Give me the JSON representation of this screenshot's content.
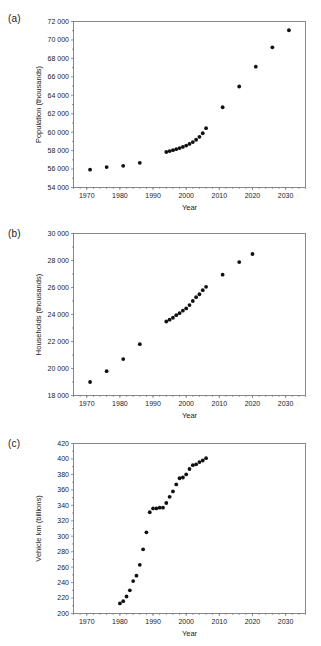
{
  "figure": {
    "background_color": "#ffffff",
    "marker_color": "#111111",
    "axis_color": "#6b6b6b"
  },
  "panels": [
    {
      "id": "a",
      "label": "(a)"
    },
    {
      "id": "b",
      "label": "(b)"
    },
    {
      "id": "c",
      "label": "(c)"
    }
  ],
  "chart_data": [
    {
      "type": "scatter",
      "panel": "(a)",
      "title": "",
      "xlabel": "Year",
      "ylabel": "Population (thousands)",
      "xlim": [
        1966,
        2036
      ],
      "ylim": [
        54000,
        72000
      ],
      "xticks": [
        1970,
        1980,
        1990,
        2000,
        2010,
        2020,
        2030
      ],
      "xticklabels": [
        "1970",
        "1980",
        "1990",
        "2000",
        "2010",
        "2020",
        "2030"
      ],
      "yticks": [
        54000,
        56000,
        58000,
        60000,
        62000,
        64000,
        66000,
        68000,
        70000,
        72000
      ],
      "yticklabels": [
        "54 000",
        "56 000",
        "58 000",
        "60 000",
        "62 000",
        "64 000",
        "66 000",
        "68 000",
        "70 000",
        "72 000"
      ],
      "grid": false,
      "legend": null,
      "x": [
        1971,
        1976,
        1981,
        1986,
        1994,
        1995,
        1996,
        1997,
        1998,
        1999,
        2000,
        2001,
        2002,
        2003,
        2004,
        2005,
        2006,
        2011,
        2016,
        2021,
        2026,
        2031
      ],
      "y": [
        55930,
        56220,
        56350,
        56680,
        57850,
        57950,
        58050,
        58160,
        58270,
        58400,
        58550,
        58720,
        58930,
        59180,
        59500,
        59880,
        60430,
        62700,
        64950,
        67100,
        69200,
        71050
      ]
    },
    {
      "type": "scatter",
      "panel": "(b)",
      "title": "",
      "xlabel": "Year",
      "ylabel": "Households (thousands)",
      "xlim": [
        1966,
        2036
      ],
      "ylim": [
        18000,
        30000
      ],
      "xticks": [
        1970,
        1980,
        1990,
        2000,
        2010,
        2020,
        2030
      ],
      "xticklabels": [
        "1970",
        "1980",
        "1990",
        "2000",
        "2010",
        "2020",
        "2030"
      ],
      "yticks": [
        18000,
        20000,
        22000,
        24000,
        26000,
        28000,
        30000
      ],
      "yticklabels": [
        "18 000",
        "20 000",
        "22 000",
        "24 000",
        "26 000",
        "28 000",
        "30 000"
      ],
      "grid": false,
      "legend": null,
      "x": [
        1971,
        1976,
        1981,
        1986,
        1994,
        1995,
        1996,
        1997,
        1998,
        1999,
        2000,
        2001,
        2002,
        2003,
        2004,
        2005,
        2006,
        2011,
        2016,
        2020
      ],
      "y": [
        19000,
        19800,
        20700,
        21800,
        23480,
        23620,
        23760,
        23950,
        24100,
        24280,
        24450,
        24700,
        25000,
        25280,
        25500,
        25800,
        26050,
        26950,
        27880,
        28480
      ]
    },
    {
      "type": "scatter",
      "panel": "(c)",
      "title": "",
      "xlabel": "Year",
      "ylabel": "Vehicle km (billions)",
      "xlim": [
        1966,
        2036
      ],
      "ylim": [
        200,
        420
      ],
      "xticks": [
        1970,
        1980,
        1990,
        2000,
        2010,
        2020,
        2030
      ],
      "xticklabels": [
        "1970",
        "1980",
        "1990",
        "2000",
        "2010",
        "2020",
        "2030"
      ],
      "yticks": [
        200,
        220,
        240,
        260,
        280,
        300,
        320,
        340,
        360,
        380,
        400,
        420
      ],
      "yticklabels": [
        "200",
        "220",
        "240",
        "260",
        "280",
        "300",
        "320",
        "340",
        "360",
        "380",
        "400",
        "420"
      ],
      "grid": false,
      "legend": null,
      "x": [
        1980,
        1981,
        1982,
        1983,
        1984,
        1985,
        1986,
        1987,
        1988,
        1989,
        1990,
        1991,
        1992,
        1993,
        1994,
        1995,
        1996,
        1997,
        1998,
        1999,
        2000,
        2001,
        2002,
        2003,
        2004,
        2005,
        2006
      ],
      "y": [
        213,
        216,
        222,
        230,
        242,
        249,
        263,
        283,
        305,
        331,
        336,
        336,
        337,
        337,
        343,
        351,
        358,
        367,
        375,
        376,
        380,
        387,
        392,
        393,
        396,
        398,
        401
      ]
    }
  ]
}
